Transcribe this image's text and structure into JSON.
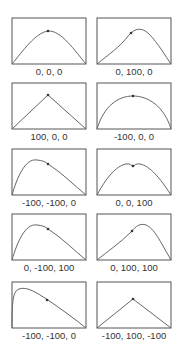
{
  "figure": {
    "box_color": "#555555",
    "curve_color": "#666666",
    "point_color": "#333333",
    "panels": [
      {
        "label": "0, 0, 0",
        "params": [
          0,
          0,
          0
        ],
        "path": "M1,47 C12,34 24,16 37,14 C50,13 64,34 75,47",
        "kx": 37,
        "ky": 14
      },
      {
        "label": "0, 100, 0",
        "params": [
          0,
          100,
          0
        ],
        "path": "M1,47 C12,38 24,30 33,18 C39,11 46,10 53,17 C62,26 70,40 75,47",
        "kx": 35,
        "ky": 16
      },
      {
        "label": "100, 0, 0",
        "params": [
          100,
          0,
          0
        ],
        "path": "M1,47 L37,13 L75,47",
        "kx": 37,
        "ky": 13
      },
      {
        "label": "-100, 0, 0",
        "params": [
          -100,
          0,
          0
        ],
        "path": "M1,47 C8,24 22,14 37,14 C52,14 68,24 75,47",
        "kx": 37,
        "ky": 14
      },
      {
        "label": "-100, -100, 0",
        "params": [
          -100,
          -100,
          0
        ],
        "path": "M1,47 C6,30 14,10 26,12 C36,13 36,16 40,18 C52,26 64,38 75,47",
        "kx": 37,
        "ky": 16
      },
      {
        "label": "0, 0, 100",
        "params": [
          0,
          0,
          100
        ],
        "path": "M1,47 C10,30 20,18 30,16 C34,15 36,18 37,18 C38,18 40,15 44,16 C54,18 64,30 75,47",
        "kx": 37,
        "ky": 18
      },
      {
        "label": "0, -100, 100",
        "params": [
          0,
          -100,
          100
        ],
        "path": "M1,47 C6,30 14,10 26,12 C36,13 36,16 40,18 C52,26 64,38 75,47",
        "kx": 37,
        "ky": 16
      },
      {
        "label": "0, 100, 100",
        "params": [
          0,
          100,
          100
        ],
        "path": "M1,47 C12,38 24,30 35,19 C40,13 44,10 50,12 C58,15 64,28 75,47",
        "kx": 36,
        "ky": 18
      },
      {
        "label": "-100, -100, 0",
        "params": [
          -100,
          -100,
          0
        ],
        "path": "M1,47 C1,20 2,10 8,8 C16,5 26,12 37,19 C50,28 64,38 75,47",
        "kx": 36,
        "ky": 19
      },
      {
        "label": "-100, 100, -100",
        "params": [
          -100,
          100,
          -100
        ],
        "path": "M1,47 L37,18 L75,47",
        "kx": 37,
        "ky": 18
      }
    ]
  }
}
